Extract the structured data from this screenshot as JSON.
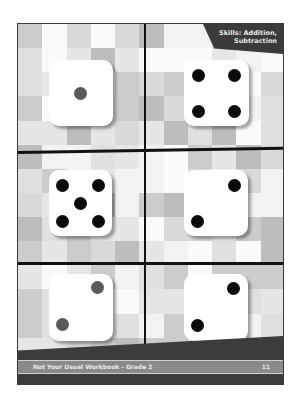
{
  "page": {
    "tag": {
      "line1": "Skills: Addition,",
      "line2": "Subtraction"
    },
    "footer": {
      "title": "Not Your Usual Workbook  -  Grade 2",
      "page_number": "11"
    },
    "colors": {
      "frame": "#3a3a3a",
      "divider": "#111111",
      "tag_bg": "#3b3b3b",
      "band": "#3c3c3c",
      "footer_bar": "#8a8a8a",
      "pip_black": "#0a0a0a",
      "pip_grey": "#5a5a5a"
    },
    "dice": [
      {
        "position": "row1-left",
        "value": 1,
        "pip_color": "grey"
      },
      {
        "position": "row1-right",
        "value": 4,
        "pip_color": "black"
      },
      {
        "position": "row2-left",
        "value": 5,
        "pip_color": "black"
      },
      {
        "position": "row2-right",
        "value": 2,
        "pip_color": "black"
      },
      {
        "position": "row3-left",
        "value": 2,
        "pip_color": "grey"
      },
      {
        "position": "row3-right",
        "value": 2,
        "pip_color": "black"
      }
    ]
  }
}
